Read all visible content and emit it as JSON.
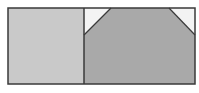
{
  "diagram": {
    "colors": {
      "background": "#ffffff",
      "left_panel": "#c9c9c9",
      "right_panel": "#a9a9a9",
      "corner_triangle": "#f3f3f3",
      "outline": "#3a3a3a"
    },
    "frame": {
      "x": 8,
      "y": 8,
      "width": 187,
      "height": 76
    },
    "divider_x": 84,
    "panels": [
      {
        "name": "left-panel",
        "x": 8,
        "y": 8,
        "width": 76,
        "height": 76
      },
      {
        "name": "right-panel",
        "x": 84,
        "y": 8,
        "width": 111,
        "height": 76
      }
    ],
    "triangles": [
      {
        "name": "top-left-corner-triangle",
        "points": "84,8 111,8 84,35"
      },
      {
        "name": "top-right-corner-triangle",
        "points": "169,8 195,8 195,35"
      }
    ]
  }
}
